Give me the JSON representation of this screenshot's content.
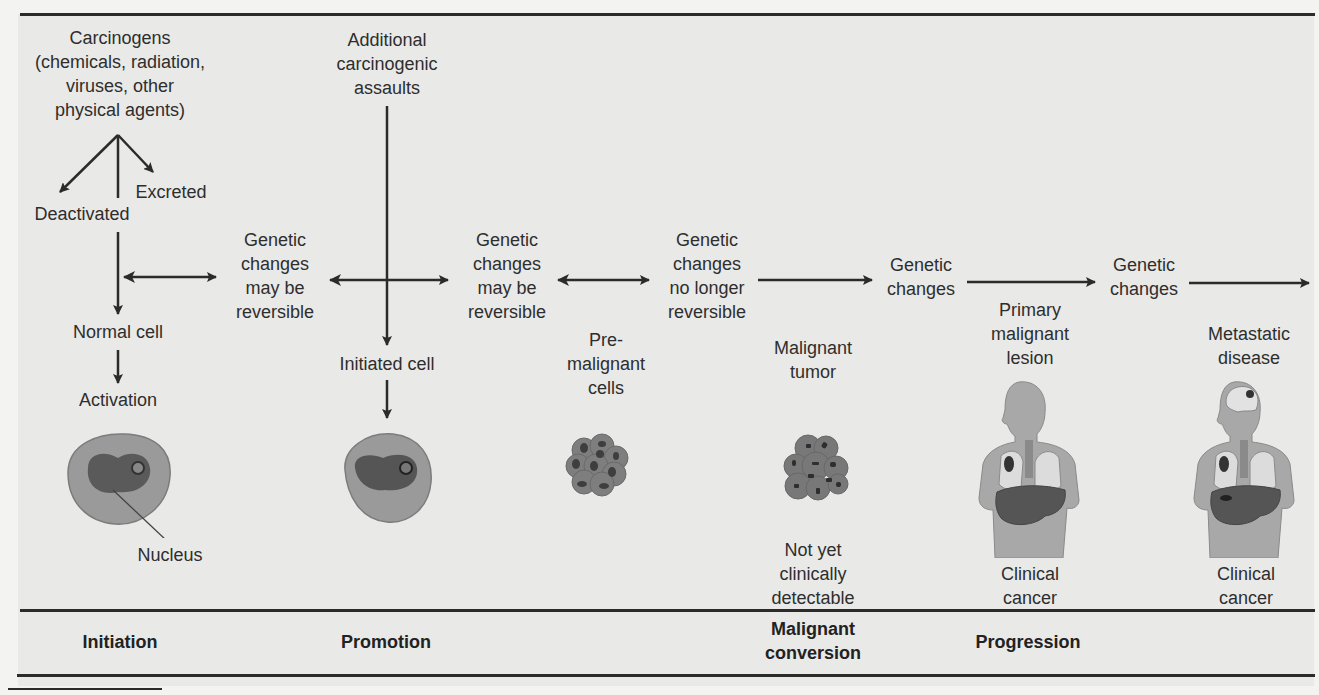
{
  "diagram": {
    "top_labels": {
      "carcinogens": "Carcinogens\n(chemicals, radiation,\nviruses, other\nphysical agents)",
      "additional_assaults": "Additional\ncarcinogenic\nassaults"
    },
    "fate_labels": {
      "excreted": "Excreted",
      "deactivated": "Deactivated"
    },
    "flow_labels": {
      "genetic_reversible_1": "Genetic\nchanges\nmay be\nreversible",
      "genetic_reversible_2": "Genetic\nchanges\nmay be\nreversible",
      "genetic_irreversible": "Genetic\nchanges\nno longer\nreversible",
      "genetic_changes_1": "Genetic\nchanges",
      "genetic_changes_2": "Genetic\nchanges"
    },
    "cell_labels": {
      "normal_cell": "Normal cell",
      "activation": "Activation",
      "nucleus": "Nucleus",
      "initiated_cell": "Initiated cell",
      "premalignant_cells": "Pre-\nmalignant\ncells",
      "malignant_tumor": "Malignant\ntumor",
      "not_detectable": "Not yet\nclinically\ndetectable",
      "primary_lesion": "Primary\nmalignant\nlesion",
      "clinical_cancer_1": "Clinical\ncancer",
      "metastatic_disease": "Metastatic\ndisease",
      "clinical_cancer_2": "Clinical\ncancer"
    },
    "stages": [
      {
        "label": "Initiation"
      },
      {
        "label": "Promotion"
      },
      {
        "label": "Malignant\nconversion"
      },
      {
        "label": "Progression"
      }
    ],
    "colors": {
      "background": "#e9e9e7",
      "cytoplasm": "#9a9a9a",
      "nucleus": "#5a5a5a",
      "tumor": "#7a7a7a",
      "body": "#a8a8a8",
      "liver": "#555555",
      "lungs": "#dcdcdc",
      "line": "#2b2b2b"
    }
  }
}
